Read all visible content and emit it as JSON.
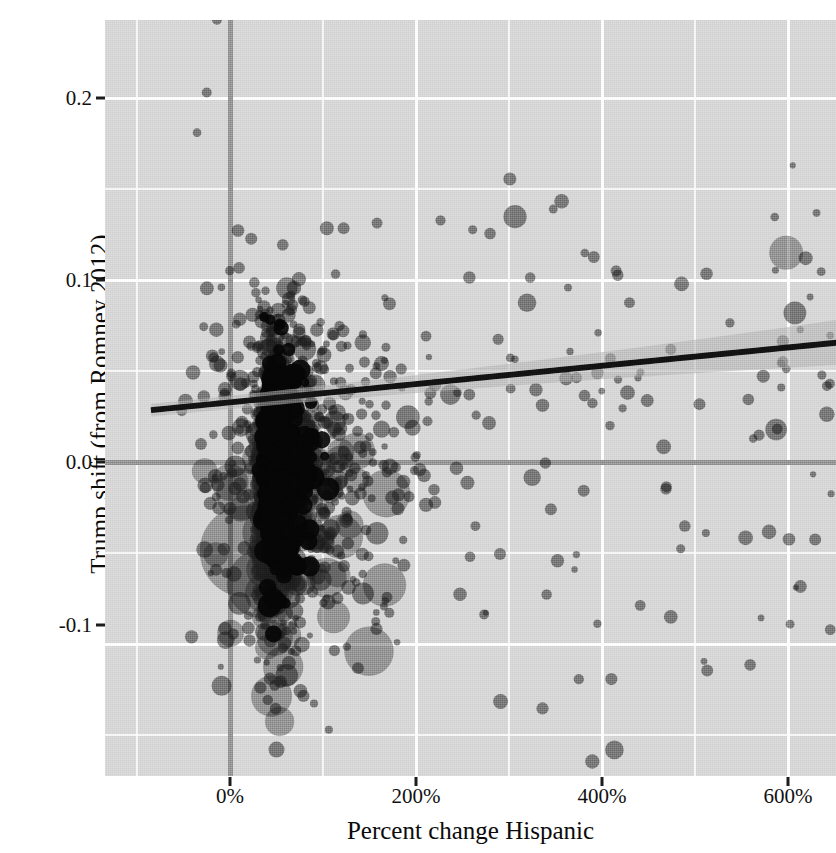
{
  "chart_data": {
    "type": "scatter",
    "title": "",
    "subtitle": "",
    "xlabel": "Percent change Hispanic",
    "ylabel": "Trump shift (from Romney 2012)",
    "xlim": [
      -115,
      670
    ],
    "ylim": [
      -0.175,
      0.255
    ],
    "x_unit": "percent",
    "grid": true,
    "legend": "none",
    "x_ticks": [
      {
        "value": 0,
        "label": "0%",
        "px": 230
      },
      {
        "value": 200,
        "label": "200%",
        "px": 416
      },
      {
        "value": 400,
        "label": "400%",
        "px": 602
      },
      {
        "value": 600,
        "label": "600%",
        "px": 788
      }
    ],
    "x_minor_ticks": [
      -100,
      100,
      300,
      500
    ],
    "y_ticks": [
      {
        "value": 0.2,
        "label": "0.2",
        "px": 98
      },
      {
        "value": 0.1,
        "label": "0.1",
        "px": 280
      },
      {
        "value": 0.0,
        "label": "0.0",
        "px": 462
      },
      {
        "value": -0.1,
        "label": "-0.1",
        "px": 625
      }
    ],
    "y_minor_ticks": [
      0.25,
      0.15,
      0.05,
      -0.05,
      -0.15
    ],
    "reference_lines": [
      {
        "name": "zero-horizontal",
        "orientation": "horizontal",
        "value": 0.0,
        "color": "#8b8b8b"
      },
      {
        "name": "zero-vertical",
        "orientation": "vertical",
        "value": 0,
        "color": "#8b8b8b"
      }
    ],
    "fit": {
      "name": "linear-regression",
      "type": "line",
      "color": "#111111",
      "band_color": "#a9a9a9",
      "x_start": -85,
      "y_start": 0.0285,
      "x_end": 660,
      "y_end": 0.066,
      "band_halfwidth_start": 0.0035,
      "band_halfwidth_end": 0.0125,
      "slope_per_100pct": 0.005
    },
    "points_style": {
      "color": "#1b1b1b",
      "opacity": 0.55,
      "marker": "circle",
      "size_encodes": "population",
      "min_radius_px": 3,
      "max_radius_px": 48
    },
    "n_points_drawn": 1380,
    "point_cloud_description": "Dense overplotted cluster of US counties centered near 40-90% Hispanic change and Trump shift between -0.12 and +0.12, with a long right tail out to 650% and several very large bubbles (large-population counties) at negative Trump shift near 0-60% change.",
    "notable_points": [
      {
        "x": -14,
        "y": 0.243,
        "r": 5,
        "note": "top outlier"
      },
      {
        "x": -25,
        "y": 0.203,
        "r": 5
      },
      {
        "x": 598,
        "y": 0.115,
        "r": 17,
        "note": "large bubble far right"
      },
      {
        "x": 619,
        "y": 0.112,
        "r": 7
      },
      {
        "x": 645,
        "y": 0.043,
        "r": 5
      },
      {
        "x": 17,
        "y": -0.049,
        "r": 46,
        "note": "very large county bubble"
      },
      {
        "x": 33,
        "y": -0.067,
        "r": 34
      },
      {
        "x": -9,
        "y": -0.123,
        "r": 10
      },
      {
        "x": 50,
        "y": -0.158,
        "r": 8
      },
      {
        "x": 345,
        "y": -0.026,
        "r": 6
      }
    ]
  },
  "axes": {
    "x_title": "Percent change Hispanic",
    "y_title": "Trump shift (from Romney 2012)"
  },
  "colors": {
    "panel_background": "#d2d2d2",
    "gridline": "#fdfdfd",
    "reference_line": "#8b8b8b",
    "point": "#1b1b1b",
    "fit_line": "#111111",
    "fit_band": "#a9a9a9",
    "text": "#111111",
    "page_background": "#ffffff"
  }
}
